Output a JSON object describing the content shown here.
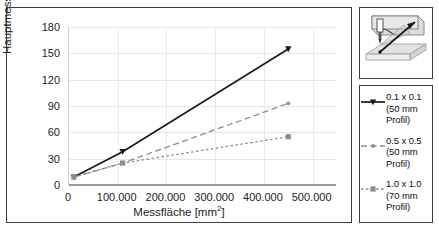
{
  "chart_data": {
    "type": "line",
    "title": "",
    "xlabel": "Messfläche [mm²]",
    "xlabel_base": "Messfläche [mm",
    "xlabel_sup": "2",
    "xlabel_tail": "]",
    "ylabel": "Hauptmesszeit [s]",
    "xlim": [
      0,
      550000
    ],
    "ylim": [
      0,
      180
    ],
    "grid": true,
    "legend_position": "right-outside",
    "xticks": [
      0,
      100000,
      200000,
      300000,
      400000,
      500000
    ],
    "xticklabels": [
      "0",
      "100.000",
      "200.000",
      "300.000",
      "400.000",
      "500.000"
    ],
    "yticks": [
      0,
      30,
      60,
      90,
      120,
      150,
      180
    ],
    "yticklabels": [
      "0",
      "30",
      "60",
      "90",
      "120",
      "150",
      "180"
    ],
    "x": [
      10000,
      110000,
      450000
    ],
    "series": [
      {
        "name": "0.1 x 0.1 (50 mm Profil)",
        "label_lines": [
          "0.1 x 0.1",
          "(50 mm",
          "Profil)"
        ],
        "values": [
          9,
          38,
          155
        ],
        "color": "#1a1a1a",
        "linestyle": "solid",
        "marker": "triangle"
      },
      {
        "name": "0.5 x 0.5 (50 mm Profil)",
        "label_lines": [
          "0.5 x 0.5",
          "(50 mm",
          "Profil)"
        ],
        "values": [
          9,
          25,
          93
        ],
        "color": "#8c8c8c",
        "linestyle": "dashed",
        "marker": "dot"
      },
      {
        "name": "1.0 x 1.0 (70 mm Profil)",
        "label_lines": [
          "1.0 x 1.0",
          "(70 mm",
          "Profil)"
        ],
        "values": [
          9,
          25,
          55
        ],
        "color": "#8c8c8c",
        "linestyle": "dotted",
        "marker": "square"
      }
    ]
  },
  "icon": {
    "name": "tactile-probe-measurement-icon",
    "caption": ""
  }
}
